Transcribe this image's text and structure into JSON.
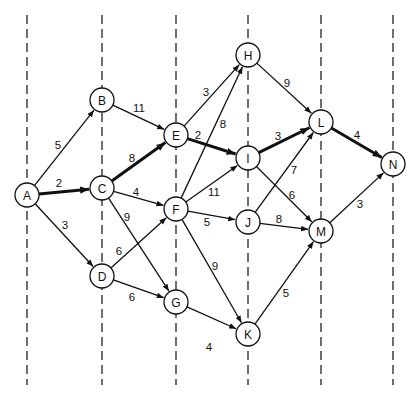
{
  "diagram": {
    "type": "directed-network-critical-path",
    "stage_lines_x": [
      27,
      102,
      176,
      248,
      321,
      393
    ],
    "stage_lines_y": [
      15,
      385
    ],
    "node_radius": 12,
    "nodes": [
      {
        "id": "A",
        "label": "A",
        "x": 27,
        "y": 195
      },
      {
        "id": "B",
        "label": "B",
        "x": 102,
        "y": 100
      },
      {
        "id": "C",
        "label": "C",
        "x": 102,
        "y": 188
      },
      {
        "id": "D",
        "label": "D",
        "x": 102,
        "y": 276
      },
      {
        "id": "E",
        "label": "E",
        "x": 176,
        "y": 135
      },
      {
        "id": "F",
        "label": "F",
        "x": 176,
        "y": 209
      },
      {
        "id": "G",
        "label": "G",
        "x": 176,
        "y": 302
      },
      {
        "id": "H",
        "label": "H",
        "x": 248,
        "y": 55
      },
      {
        "id": "I",
        "label": "I",
        "x": 248,
        "y": 158
      },
      {
        "id": "J",
        "label": "J",
        "x": 248,
        "y": 222
      },
      {
        "id": "K",
        "label": "K",
        "x": 248,
        "y": 334
      },
      {
        "id": "L",
        "label": "L",
        "x": 321,
        "y": 122
      },
      {
        "id": "M",
        "label": "M",
        "x": 321,
        "y": 231
      },
      {
        "id": "N",
        "label": "N",
        "x": 393,
        "y": 164
      }
    ],
    "edges": [
      {
        "from": "A",
        "to": "B",
        "weight": "5",
        "critical": false,
        "lx": 58,
        "ly": 145
      },
      {
        "from": "A",
        "to": "C",
        "weight": "2",
        "critical": true,
        "lx": 59,
        "ly": 183
      },
      {
        "from": "A",
        "to": "D",
        "weight": "3",
        "critical": false,
        "lx": 65,
        "ly": 225
      },
      {
        "from": "B",
        "to": "E",
        "weight": "11",
        "critical": false,
        "lx": 139,
        "ly": 108
      },
      {
        "from": "C",
        "to": "E",
        "weight": "8",
        "critical": true,
        "lx": 132,
        "ly": 158
      },
      {
        "from": "C",
        "to": "F",
        "weight": "4",
        "critical": false,
        "lx": 136,
        "ly": 192
      },
      {
        "from": "C",
        "to": "G",
        "weight": "9",
        "critical": false,
        "lx": 127,
        "ly": 217
      },
      {
        "from": "D",
        "to": "F",
        "weight": "6",
        "critical": false,
        "lx": 119,
        "ly": 251
      },
      {
        "from": "D",
        "to": "G",
        "weight": "6",
        "critical": false,
        "lx": 132,
        "ly": 297
      },
      {
        "from": "E",
        "to": "H",
        "weight": "3",
        "critical": false,
        "lx": 206,
        "ly": 92
      },
      {
        "from": "E",
        "to": "I",
        "weight": "2",
        "critical": true,
        "lx": 198,
        "ly": 135
      },
      {
        "from": "F",
        "to": "H",
        "weight": "8",
        "critical": false,
        "lx": 223,
        "ly": 124
      },
      {
        "from": "F",
        "to": "I",
        "weight": "11",
        "critical": false,
        "lx": 214,
        "ly": 192
      },
      {
        "from": "F",
        "to": "J",
        "weight": "5",
        "critical": false,
        "lx": 207,
        "ly": 222
      },
      {
        "from": "F",
        "to": "K",
        "weight": "9",
        "critical": false,
        "lx": 215,
        "ly": 266
      },
      {
        "from": "G",
        "to": "K",
        "weight": "4",
        "critical": false,
        "lx": 209,
        "ly": 347
      },
      {
        "from": "H",
        "to": "L",
        "weight": "9",
        "critical": false,
        "lx": 287,
        "ly": 83
      },
      {
        "from": "I",
        "to": "L",
        "weight": "3",
        "critical": true,
        "lx": 278,
        "ly": 136
      },
      {
        "from": "I",
        "to": "M",
        "weight": "6",
        "critical": false,
        "lx": 292,
        "ly": 195
      },
      {
        "from": "J",
        "to": "L",
        "weight": "7",
        "critical": false,
        "lx": 294,
        "ly": 170
      },
      {
        "from": "J",
        "to": "M",
        "weight": "8",
        "critical": false,
        "lx": 279,
        "ly": 219
      },
      {
        "from": "K",
        "to": "M",
        "weight": "5",
        "critical": false,
        "lx": 286,
        "ly": 293
      },
      {
        "from": "L",
        "to": "N",
        "weight": "4",
        "critical": true,
        "lx": 357,
        "ly": 135
      },
      {
        "from": "M",
        "to": "N",
        "weight": "3",
        "critical": false,
        "lx": 360,
        "ly": 204
      }
    ],
    "critical_path": [
      "A",
      "C",
      "E",
      "I",
      "L",
      "N"
    ]
  }
}
